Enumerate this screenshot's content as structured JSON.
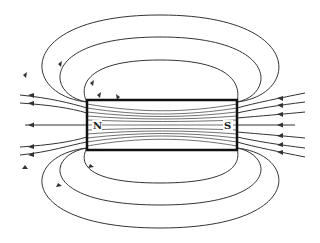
{
  "diagram": {
    "magnet": {
      "north_label": "N",
      "south_label": "S"
    },
    "colors": {
      "line": "#333333",
      "magnet_border": "#111111",
      "background": "#ffffff"
    }
  }
}
